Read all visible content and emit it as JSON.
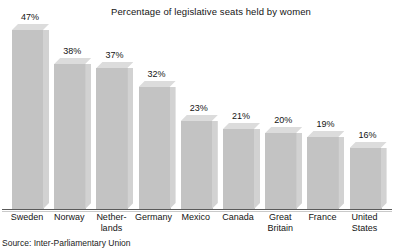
{
  "chart_data": {
    "type": "bar",
    "title": "Percentage of legislative seats held by women",
    "xlabel": "",
    "ylabel": "",
    "ylim": [
      0,
      47
    ],
    "grid": false,
    "legend": "none",
    "categories": [
      "Sweden",
      "Netherlands",
      "Norway",
      "Germany",
      "Mexico",
      "Canada",
      "Great Britain",
      "France",
      "United States"
    ],
    "values": [
      47,
      38,
      37,
      32,
      23,
      21,
      20,
      19,
      16
    ],
    "value_labels": [
      "47%",
      "38%",
      "37%",
      "32%",
      "23%",
      "21%",
      "20%",
      "19%",
      "16%"
    ],
    "bars": [
      {
        "category": "Sweden",
        "value": 47,
        "label": "47%",
        "tick_lines": [
          "Sweden"
        ]
      },
      {
        "category": "Norway",
        "value": 38,
        "label": "38%",
        "tick_lines": [
          "Norway"
        ]
      },
      {
        "category": "Netherlands",
        "value": 37,
        "label": "37%",
        "tick_lines": [
          "Nether-",
          "lands"
        ]
      },
      {
        "category": "Germany",
        "value": 32,
        "label": "32%",
        "tick_lines": [
          "Germany"
        ]
      },
      {
        "category": "Mexico",
        "value": 23,
        "label": "23%",
        "tick_lines": [
          "Mexico"
        ]
      },
      {
        "category": "Canada",
        "value": 21,
        "label": "21%",
        "tick_lines": [
          "Canada"
        ]
      },
      {
        "category": "Great Britain",
        "value": 20,
        "label": "20%",
        "tick_lines": [
          "Great",
          "Britain"
        ]
      },
      {
        "category": "France",
        "value": 19,
        "label": "19%",
        "tick_lines": [
          "France"
        ]
      },
      {
        "category": "United States",
        "value": 16,
        "label": "16%",
        "tick_lines": [
          "United",
          "States"
        ]
      }
    ]
  },
  "source": {
    "text": "Source: Inter-Parliamentary Union"
  },
  "colors": {
    "bar_front": "#c3c3c3",
    "bar_side": "#d2d2d2",
    "bar_top": "#dcdcdc",
    "axis": "#5a5a5a",
    "text": "#141414",
    "background": "#ffffff"
  }
}
